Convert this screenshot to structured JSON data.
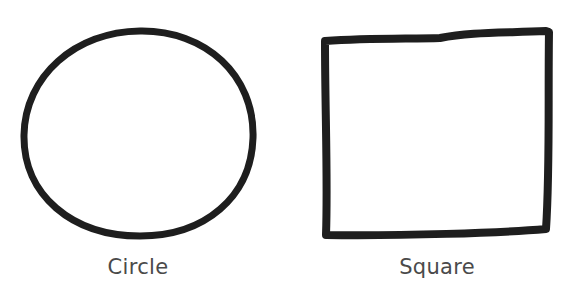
{
  "figures": [
    {
      "name": "circle",
      "label": "Circle"
    },
    {
      "name": "square",
      "label": "Square"
    }
  ],
  "colors": {
    "stroke": "#1e1e1e",
    "label": "#4a4a4a",
    "background": "#ffffff"
  }
}
